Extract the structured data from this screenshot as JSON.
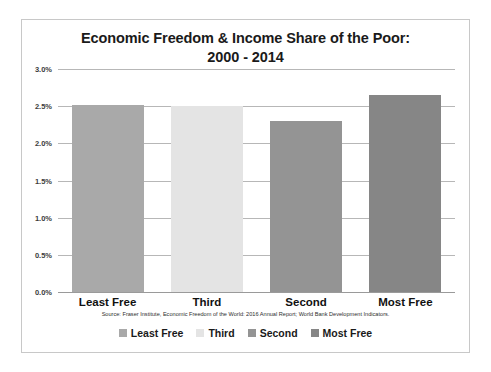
{
  "chart_data": {
    "type": "bar",
    "title": "Economic Freedom & Income Share of the Poor:",
    "subtitle": "2000 - 2014",
    "categories": [
      "Least Free",
      "Third",
      "Second",
      "Most Free"
    ],
    "values": [
      2.51,
      2.5,
      2.3,
      2.65
    ],
    "value_labels": [
      "2.51%",
      "2.50%",
      "2.30%",
      "2.65%"
    ],
    "series": [
      {
        "name": "Income Share of the Poor",
        "values": [
          2.51,
          2.5,
          2.3,
          2.65
        ]
      }
    ],
    "xlabel": "",
    "ylabel": "",
    "ylim": [
      0.0,
      3.0
    ],
    "ytick_values": [
      0.0,
      0.5,
      1.0,
      1.5,
      2.0,
      2.5,
      3.0
    ],
    "ytick_labels": [
      "0.0%",
      "0.5%",
      "1.0%",
      "1.5%",
      "2.0%",
      "2.5%",
      "3.0%"
    ],
    "grid": true,
    "legend_position": "bottom",
    "legend": [
      {
        "label": "Least Free",
        "color": "#a9a9a9"
      },
      {
        "label": "Third",
        "color": "#e4e4e4"
      },
      {
        "label": "Second",
        "color": "#949494"
      },
      {
        "label": "Most Free",
        "color": "#868686"
      }
    ],
    "bar_colors": [
      "#a9a9a9",
      "#e4e4e4",
      "#949494",
      "#868686"
    ],
    "annotations": [
      "Source: Fraser Institute, Economic Freedom of the World: 2016 Annual Report;  World Bank Development Indicators."
    ]
  },
  "source_note": "Source: Fraser Institute, Economic Freedom of the World: 2016 Annual Report;  World Bank Development Indicators.",
  "colors": {
    "card_border": "#c8c8c8",
    "gridline": "#b7b7b7",
    "axis": "#9a9a9a",
    "title_text": "#1a1a1a",
    "tick_text": "#3c3c3c"
  }
}
